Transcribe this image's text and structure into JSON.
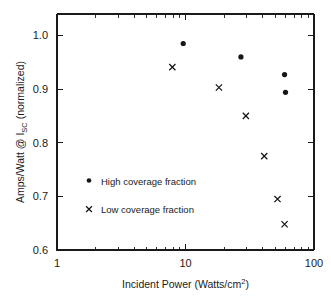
{
  "chart_data": {
    "type": "scatter",
    "title": "",
    "xlabel": "Incident Power (Watts/cm2)",
    "xlabel_base": "Incident Power (Watts/cm",
    "xlabel_exponent": "2",
    "xlabel_close": ")",
    "ylabel": "Amps/Watt @ ISC (normalized)",
    "ylabel_part1": "Amps/Watt @ I",
    "ylabel_subscript": "SC",
    "ylabel_part2": " (normalized)",
    "xscale": "log",
    "yscale": "linear",
    "xlim": [
      1,
      100
    ],
    "ylim": [
      0.6,
      1.04
    ],
    "grid": false,
    "legend_position": "center-left-inside",
    "x_tick_labels": [
      "1",
      "10",
      "100"
    ],
    "x_tick_values": [
      1,
      10,
      100
    ],
    "y_tick_labels": [
      "0.6",
      "0.7",
      "0.8",
      "0.9",
      "1.0"
    ],
    "y_tick_values": [
      0.6,
      0.7,
      0.8,
      0.9,
      1.0
    ],
    "series": [
      {
        "name": "High coverage fraction",
        "marker": "filled-circle",
        "color": "#161616",
        "x": [
          9.6,
          27.0,
          59.0,
          60.0
        ],
        "y": [
          0.985,
          0.96,
          0.927,
          0.894
        ]
      },
      {
        "name": "Low coverage fraction",
        "marker": "cross",
        "color": "#161616",
        "x": [
          7.9,
          18.2,
          29.5,
          41.0,
          52.0,
          59.0
        ],
        "y": [
          0.941,
          0.903,
          0.85,
          0.775,
          0.695,
          0.648
        ]
      }
    ]
  },
  "legend": {
    "entries": [
      {
        "label": "High coverage fraction",
        "marker": "filled-circle"
      },
      {
        "label": "Low coverage fraction",
        "marker": "cross"
      }
    ]
  }
}
